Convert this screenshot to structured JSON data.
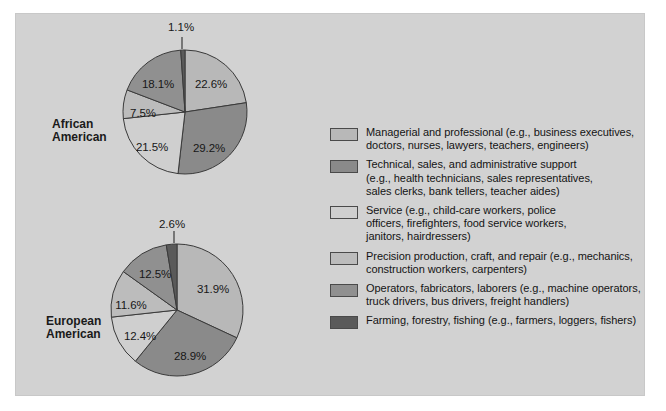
{
  "chart_data": {
    "type": "pie",
    "title": "",
    "legend_position": "right",
    "colors": {
      "panel_background": "#d2d2d2",
      "managerial": "#b8b8b8",
      "technical": "#8a8a8a",
      "service": "#cfcfcf",
      "precision": "#bcbcbc",
      "operators": "#909090",
      "farming": "#5a5a5a",
      "outline": "#3a3a3a"
    },
    "categories": [
      "Managerial and professional",
      "Technical, sales, and administrative support",
      "Service",
      "Precision production, craft, and repair",
      "Operators, fabricators, laborers",
      "Farming, forestry, fishing"
    ],
    "series": [
      {
        "name": "African American",
        "values": [
          22.6,
          29.2,
          21.5,
          7.5,
          18.1,
          1.1
        ],
        "labels": [
          "22.6%",
          "29.2%",
          "21.5%",
          "7.5%",
          "18.1%",
          "1.1%"
        ]
      },
      {
        "name": "European American",
        "values": [
          31.9,
          28.9,
          12.4,
          11.6,
          12.5,
          2.6
        ],
        "labels": [
          "31.9%",
          "28.9%",
          "12.4%",
          "11.6%",
          "12.5%",
          "2.6%"
        ]
      }
    ]
  },
  "pies": [
    {
      "row_label_line1": "African",
      "row_label_line2": "American",
      "slices": [
        {
          "label": "22.6%",
          "value": 22.6,
          "color": "#b8b8b8",
          "lx": 211,
          "ly": 84
        },
        {
          "label": "29.2%",
          "value": 29.2,
          "color": "#8a8a8a",
          "lx": 209,
          "ly": 148
        },
        {
          "label": "21.5%",
          "value": 21.5,
          "color": "#cfcfcf",
          "lx": 152,
          "ly": 147
        },
        {
          "label": "7.5%",
          "value": 7.5,
          "color": "#bcbcbc",
          "lx": 143,
          "ly": 113
        },
        {
          "label": "18.1%",
          "value": 18.1,
          "color": "#909090",
          "lx": 158,
          "ly": 84
        },
        {
          "label": "1.1%",
          "value": 1.1,
          "color": "#5a5a5a",
          "lx": 181,
          "ly": 27
        }
      ]
    },
    {
      "row_label_line1": "European",
      "row_label_line2": "American",
      "slices": [
        {
          "label": "31.9%",
          "value": 31.9,
          "color": "#b8b8b8",
          "lx": 213,
          "ly": 289
        },
        {
          "label": "28.9%",
          "value": 28.9,
          "color": "#8a8a8a",
          "lx": 190,
          "ly": 356
        },
        {
          "label": "12.4%",
          "value": 12.4,
          "color": "#cfcfcf",
          "lx": 140,
          "ly": 336
        },
        {
          "label": "11.6%",
          "value": 11.6,
          "color": "#bcbcbc",
          "lx": 131,
          "ly": 305
        },
        {
          "label": "12.5%",
          "value": 12.5,
          "color": "#909090",
          "lx": 155,
          "ly": 274
        },
        {
          "label": "2.6%",
          "value": 2.6,
          "color": "#5a5a5a",
          "lx": 172,
          "ly": 224
        }
      ]
    }
  ],
  "legend": {
    "items": [
      {
        "color": "#b8b8b8",
        "lines": [
          "Managerial and professional (e.g., business executives,",
          "doctors, nurses, lawyers, teachers, engineers)"
        ]
      },
      {
        "color": "#8a8a8a",
        "lines": [
          "Technical, sales, and administrative support",
          "(e.g., health technicians, sales representatives,",
          "sales clerks, bank tellers, teacher aides)"
        ]
      },
      {
        "color": "#cfcfcf",
        "lines": [
          "Service (e.g., child-care workers, police",
          "officers, firefighters, food service workers,",
          "janitors, hairdressers)"
        ]
      },
      {
        "color": "#bcbcbc",
        "lines": [
          "Precision production, craft, and repair (e.g., mechanics,",
          "construction workers, carpenters)"
        ]
      },
      {
        "color": "#909090",
        "lines": [
          "Operators, fabricators, laborers (e.g., machine operators,",
          "truck drivers, bus drivers, freight handlers)"
        ]
      },
      {
        "color": "#5a5a5a",
        "lines": [
          "Farming, forestry, fishing (e.g., farmers, loggers, fishers)"
        ]
      }
    ]
  }
}
